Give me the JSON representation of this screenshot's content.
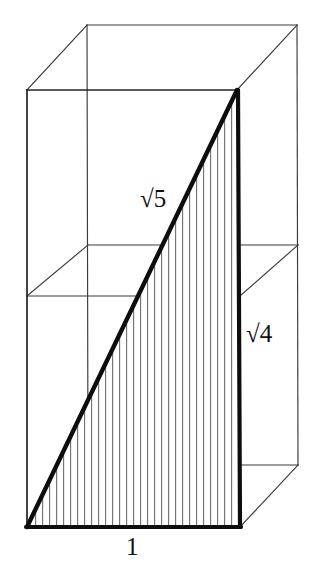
{
  "figure": {
    "background_color": "#ffffff",
    "line_color": "#1a1a1a",
    "thin_line_color": "#3a3a3a",
    "hatch_color": "#6b6b6b",
    "labels": {
      "hypotenuse": "√5",
      "vertical": "√4",
      "base": "1"
    },
    "label_meanings": {
      "hypotenuse": "sqrt-5-diagonal-label",
      "vertical": "sqrt-4-height-label",
      "base": "unit-base-label"
    },
    "geometry": {
      "front_face": {
        "top_left": [
          27,
          90
        ],
        "top_right": [
          237,
          90
        ],
        "bottom_right": [
          240,
          527
        ],
        "bottom_left": [
          27,
          527
        ]
      },
      "back_face": {
        "top_left": [
          87,
          25
        ],
        "top_right": [
          297,
          25
        ],
        "bottom_right": [
          298,
          465
        ],
        "bottom_left": [
          88,
          465
        ]
      },
      "mid_plane": {
        "front_left": [
          27,
          296
        ],
        "front_right": [
          240,
          296
        ],
        "back_right": [
          298,
          245
        ],
        "back_left": [
          88,
          245
        ]
      },
      "bold_triangle": {
        "base_start": [
          27,
          527
        ],
        "base_end": [
          240,
          527
        ],
        "apex": [
          237,
          90
        ]
      },
      "hatch_spacing_px": 7,
      "projection_offset": [
        60,
        -62
      ]
    }
  }
}
